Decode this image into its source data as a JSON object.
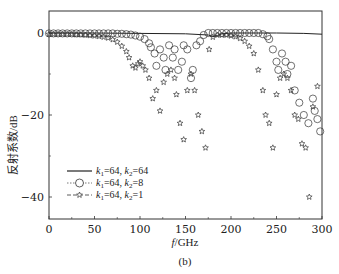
{
  "figure": {
    "caption": "(b)",
    "xlabel_italic": "f",
    "xlabel_unit": "/GHz",
    "ylabel": "反射系数/dB"
  },
  "legend": [
    {
      "label": "k1=64, k2=64",
      "marker": "solid-line"
    },
    {
      "label": "k1=64, k2=8",
      "marker": "circle"
    },
    {
      "label": "k1=64, k2=1",
      "marker": "star"
    }
  ],
  "chart_data": {
    "type": "scatter",
    "title": "",
    "xlabel": "f/GHz",
    "ylabel": "反射系数/dB",
    "xlim": [
      0,
      300
    ],
    "ylim": [
      -47,
      5
    ],
    "xticks": [
      0,
      50,
      100,
      150,
      200,
      250,
      300
    ],
    "yticks": [
      0,
      -20,
      -40
    ],
    "grid": false,
    "legend_position": "lower left",
    "series": [
      {
        "name": "k1=64, k2=64",
        "style": "line",
        "x": [
          0,
          50,
          100,
          150,
          175,
          180,
          185,
          190,
          200,
          250,
          280,
          300
        ],
        "y": [
          0,
          0,
          -0.1,
          -0.2,
          -0.5,
          -0.9,
          -0.6,
          -0.2,
          0,
          0,
          -0.1,
          -0.3
        ]
      },
      {
        "name": "k1=64, k2=8",
        "style": "circle",
        "x": [
          0,
          5,
          10,
          15,
          20,
          25,
          30,
          35,
          40,
          45,
          50,
          55,
          60,
          65,
          70,
          75,
          80,
          85,
          90,
          95,
          100,
          105,
          110,
          112,
          116,
          118,
          122,
          126,
          128,
          132,
          136,
          138,
          142,
          146,
          148,
          152,
          156,
          158,
          162,
          166,
          170,
          175,
          180,
          185,
          190,
          195,
          200,
          205,
          210,
          215,
          220,
          225,
          230,
          235,
          240,
          242,
          246,
          250,
          252,
          256,
          260,
          262,
          266,
          270,
          275,
          280,
          285,
          290,
          292,
          295,
          298
        ],
        "y": [
          -0.1,
          -0.1,
          -0.1,
          -0.1,
          -0.1,
          -0.1,
          -0.1,
          -0.1,
          -0.1,
          -0.1,
          -0.1,
          -0.1,
          -0.1,
          -0.1,
          -0.1,
          -0.2,
          -0.2,
          -0.3,
          -0.4,
          -0.6,
          -0.9,
          -1.5,
          -2.5,
          -3.5,
          -5,
          -8,
          -4,
          -6,
          -9,
          -3,
          -6,
          -4,
          -9,
          -7,
          -3,
          -4,
          -11,
          -9,
          -3,
          -2,
          -0.5,
          0,
          0,
          0,
          0,
          0,
          0,
          0,
          0,
          0,
          0,
          0,
          0,
          -0.3,
          -0.8,
          -1.5,
          -4,
          -7,
          -9,
          -5,
          -7,
          -10,
          -8,
          -14,
          -17,
          -20,
          -22,
          -16,
          -19,
          -21,
          -24
        ]
      },
      {
        "name": "k1=64, k2=1",
        "style": "star",
        "x": [
          0,
          5,
          10,
          15,
          20,
          25,
          30,
          35,
          40,
          45,
          50,
          55,
          60,
          65,
          70,
          75,
          80,
          85,
          88,
          92,
          95,
          98,
          100,
          103,
          106,
          110,
          114,
          118,
          122,
          126,
          130,
          134,
          138,
          140,
          144,
          148,
          152,
          156,
          160,
          164,
          168,
          172,
          176,
          180,
          185,
          190,
          195,
          200,
          205,
          210,
          215,
          220,
          225,
          230,
          235,
          238,
          242,
          246,
          250,
          254,
          258,
          262,
          266,
          270,
          274,
          278,
          282,
          286,
          290,
          295
        ],
        "y": [
          -0.3,
          -0.3,
          -0.3,
          -0.3,
          -0.3,
          -0.3,
          -0.4,
          -0.4,
          -0.5,
          -0.6,
          -0.7,
          -0.8,
          -1.0,
          -1.2,
          -1.6,
          -2.2,
          -3.2,
          -4.5,
          -6,
          -8,
          -8.5,
          -7.5,
          -7,
          -8,
          -9,
          -11,
          -16,
          -14,
          -19,
          -12,
          -10,
          -9,
          -11,
          -15,
          -22,
          -26,
          -14,
          -10,
          -14,
          -20,
          -24,
          -28,
          -4,
          -1,
          -0.5,
          -0.5,
          -0.5,
          -0.7,
          -0.9,
          -1.3,
          -2,
          -3.2,
          -5,
          -9,
          -14,
          -20,
          -22,
          -28,
          -15,
          -11,
          -10,
          -11,
          -14,
          -20,
          -21,
          -27,
          -28,
          -40,
          -18,
          -13
        ]
      }
    ],
    "annotations": [
      {
        "text": "(b)",
        "position": "below x-axis label"
      }
    ]
  }
}
